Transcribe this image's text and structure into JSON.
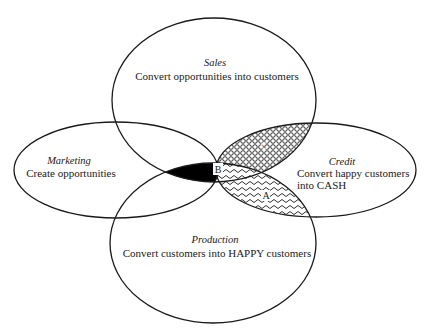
{
  "diagram": {
    "type": "venn",
    "colors": {
      "stroke": "#1a1a1a",
      "background": "#ffffff",
      "region_b_fill": "#000000"
    },
    "sets": [
      {
        "id": "sales",
        "title": "Sales",
        "description": "Convert opportunities into customers"
      },
      {
        "id": "marketing",
        "title": "Marketing",
        "description": "Create opportunities"
      },
      {
        "id": "credit",
        "title": "Credit",
        "description_line1": "Convert happy customers",
        "description_line2": "into CASH"
      },
      {
        "id": "production",
        "title": "Production",
        "description": "Convert customers into HAPPY customers"
      }
    ],
    "regions": [
      {
        "id": "A",
        "label": "A",
        "between": [
          "credit",
          "production"
        ],
        "fill_pattern": "wavy-lines"
      },
      {
        "id": "B",
        "label": "B",
        "between": [
          "sales",
          "marketing",
          "production"
        ],
        "fill_pattern": "solid-black"
      },
      {
        "id": "C",
        "label": "C",
        "between": [
          "sales",
          "credit"
        ],
        "fill_pattern": "circles-mesh"
      }
    ]
  }
}
